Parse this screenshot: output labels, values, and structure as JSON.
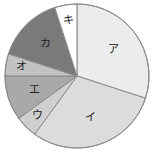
{
  "chart_data": {
    "type": "pie",
    "title": "",
    "start_angle_deg": 0,
    "direction": "clockwise",
    "categories": [
      "ア",
      "イ",
      "ウ",
      "エ",
      "オ",
      "カ",
      "キ"
    ],
    "values": [
      30,
      30,
      5,
      10,
      5,
      15,
      5
    ],
    "colors": [
      "#ececec",
      "#dcdcdc",
      "#cfcfcf",
      "#a9a9a9",
      "#c2c2c2",
      "#7a7a7a",
      "#ffffff"
    ],
    "stroke": "#8a8a8a",
    "legend": "none",
    "labels_inside": true
  }
}
